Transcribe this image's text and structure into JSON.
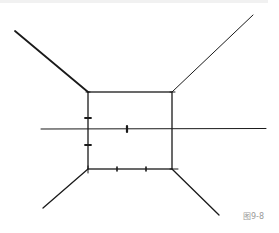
{
  "figure": {
    "caption": "图9-8",
    "colors": {
      "line": "#1a1a1a",
      "caption": "#9a9a9a",
      "background": "#ffffff"
    }
  },
  "diagram": {
    "back_wall": {
      "x1": 88,
      "y1": 92,
      "x2": 172,
      "y2": 169
    },
    "horizon": {
      "y": 129,
      "x1": 41,
      "x2": 266
    },
    "diagonals": [
      {
        "name": "top-left",
        "from": [
          15,
          31
        ],
        "to": [
          88,
          92
        ]
      },
      {
        "name": "top-right",
        "from": [
          253,
          15
        ],
        "to": [
          172,
          92
        ]
      },
      {
        "name": "bottom-left",
        "from": [
          43,
          208
        ],
        "to": [
          88,
          169
        ]
      },
      {
        "name": "bottom-right",
        "from": [
          219,
          215
        ],
        "to": [
          172,
          169
        ]
      }
    ],
    "ticks": [
      {
        "x": 88,
        "y": 118,
        "orient": "h"
      },
      {
        "x": 88,
        "y": 145,
        "orient": "h"
      },
      {
        "x": 127,
        "y": 129,
        "orient": "v"
      },
      {
        "x": 117,
        "y": 169,
        "orient": "v"
      },
      {
        "x": 146,
        "y": 169,
        "orient": "v"
      }
    ]
  }
}
